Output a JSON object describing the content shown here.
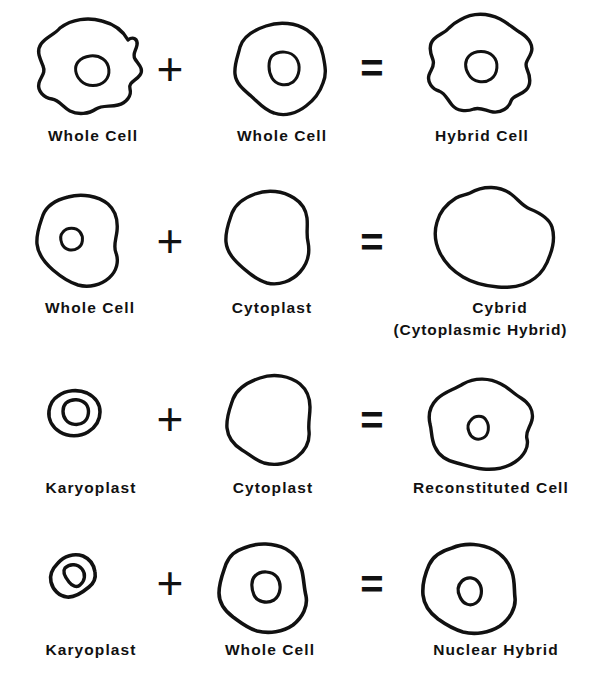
{
  "figure": {
    "background_color": "#ffffff",
    "ink_color": "#111111",
    "operators": {
      "plus": "+",
      "equals": "="
    },
    "rows": [
      {
        "id": "row-hybrid-cell",
        "operand_a": {
          "label": "Whole Cell",
          "shape": "amoeboid-cell-with-nucleus",
          "has_nucleus": true
        },
        "operator_1": "+",
        "operand_b": {
          "label": "Whole Cell",
          "shape": "rounded-cell-with-nucleus",
          "has_nucleus": true
        },
        "operator_2": "=",
        "result": {
          "label": "Hybrid Cell",
          "label_line_2": "",
          "shape": "lobed-cell-with-nucleus",
          "has_nucleus": true
        }
      },
      {
        "id": "row-cybrid",
        "operand_a": {
          "label": "Whole Cell",
          "shape": "round-cell-with-small-nucleus",
          "has_nucleus": true
        },
        "operator_1": "+",
        "operand_b": {
          "label": "Cytoplast",
          "shape": "enucleated-cell",
          "has_nucleus": false
        },
        "operator_2": "=",
        "result": {
          "label": "Cybrid",
          "label_line_2": "(Cytoplasmic Hybrid)",
          "shape": "large-enucleated-cell",
          "has_nucleus": false
        }
      },
      {
        "id": "row-reconstituted-cell",
        "operand_a": {
          "label": "Karyoplast",
          "shape": "small-karyoplast",
          "has_nucleus": true
        },
        "operator_1": "+",
        "operand_b": {
          "label": "Cytoplast",
          "shape": "enucleated-cell",
          "has_nucleus": false
        },
        "operator_2": "=",
        "result": {
          "label": "Reconstituted Cell",
          "label_line_2": "",
          "shape": "round-cell-with-small-nucleus",
          "has_nucleus": true
        }
      },
      {
        "id": "row-nuclear-hybrid",
        "operand_a": {
          "label": "Karyoplast",
          "shape": "small-karyoplast",
          "has_nucleus": true
        },
        "operator_1": "+",
        "operand_b": {
          "label": "Whole Cell",
          "shape": "square-round-cell-with-nucleus",
          "has_nucleus": true
        },
        "operator_2": "=",
        "result": {
          "label": "Nuclear Hybrid",
          "label_line_2": "",
          "shape": "round-cell-with-nucleus",
          "has_nucleus": true
        }
      }
    ]
  }
}
